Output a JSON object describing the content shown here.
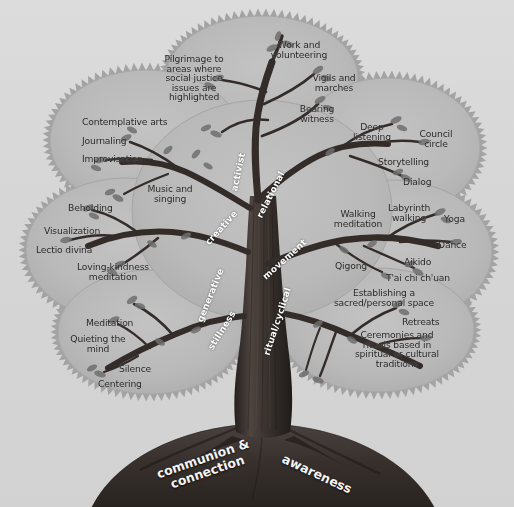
{
  "figure": {
    "background_color": "#d6d6d6",
    "canopy_color": "#b9b9b9",
    "trunk_color": "#3a3330",
    "branch_label_color": "#ffffff",
    "leaf_label_color": "#2a2a2a"
  },
  "roots": [
    {
      "name": "root-communion",
      "label": "communion &\nconnection",
      "rotation": -21
    },
    {
      "name": "root-awareness",
      "label": "awareness",
      "rotation": 26
    }
  ],
  "branches": [
    {
      "name": "branch-activist",
      "label": "activist",
      "rotation": 78
    },
    {
      "name": "branch-relational",
      "label": "relational",
      "rotation": 64
    },
    {
      "name": "branch-creative",
      "label": "creative",
      "rotation": -46
    },
    {
      "name": "branch-movement",
      "label": "movement",
      "rotation": 40
    },
    {
      "name": "branch-generative",
      "label": "generative",
      "rotation": 70
    },
    {
      "name": "branch-stillness",
      "label": "stillness",
      "rotation": 56
    },
    {
      "name": "branch-ritual-cyclical",
      "label": "ritual/cyclical",
      "rotation": 74
    }
  ],
  "practices": {
    "activist": [
      {
        "name": "practice-pilgrimage",
        "label": "Pilgrimage to\nareas where\nsocial justice\nissues are\nhighlighted"
      },
      {
        "name": "practice-work",
        "label": "Work and\nvolunteering"
      },
      {
        "name": "practice-vigils",
        "label": "Vigils and\nmarches"
      },
      {
        "name": "practice-bearing",
        "label": "Bearing\nwitness"
      }
    ],
    "relational": [
      {
        "name": "practice-deep-listening",
        "label": "Deep\nlistening"
      },
      {
        "name": "practice-council-circle",
        "label": "Council\ncircle"
      },
      {
        "name": "practice-storytelling",
        "label": "Storytelling"
      },
      {
        "name": "practice-dialog",
        "label": "Dialog"
      }
    ],
    "creative": [
      {
        "name": "practice-contemplative-arts",
        "label": "Contemplative arts"
      },
      {
        "name": "practice-journaling",
        "label": "Journaling"
      },
      {
        "name": "practice-improvisation",
        "label": "Improvisation"
      },
      {
        "name": "practice-music-singing",
        "label": "Music and\nsinging"
      }
    ],
    "generative": [
      {
        "name": "practice-beholding",
        "label": "Beholding"
      },
      {
        "name": "practice-visualization",
        "label": "Visualization"
      },
      {
        "name": "practice-lectio-divina",
        "label": "Lectio divina"
      },
      {
        "name": "practice-loving-kindness",
        "label": "Loving-kindness\nmeditation"
      }
    ],
    "stillness": [
      {
        "name": "practice-meditation",
        "label": "Meditation"
      },
      {
        "name": "practice-quieting",
        "label": "Quieting the\nmind"
      },
      {
        "name": "practice-silence",
        "label": "Silence"
      },
      {
        "name": "practice-centering",
        "label": "Centering"
      }
    ],
    "movement": [
      {
        "name": "practice-walking-meditation",
        "label": "Walking\nmeditation"
      },
      {
        "name": "practice-labyrinth-walking",
        "label": "Labyrinth\nwalking"
      },
      {
        "name": "practice-yoga",
        "label": "Yoga"
      },
      {
        "name": "practice-dance",
        "label": "Dance"
      },
      {
        "name": "practice-aikido",
        "label": "Aikido"
      },
      {
        "name": "practice-qigong",
        "label": "Qigong"
      },
      {
        "name": "practice-taichi",
        "label": "T'ai chi ch'uan"
      }
    ],
    "ritual_cyclical": [
      {
        "name": "practice-sacred-space",
        "label": "Establishing a\nsacred/personal space"
      },
      {
        "name": "practice-retreats",
        "label": "Retreats"
      },
      {
        "name": "practice-ceremonies",
        "label": "Ceremonies and\nrituals based in\nspiritual or cultural\ntraditions"
      }
    ]
  },
  "caption": {
    "text": ""
  }
}
